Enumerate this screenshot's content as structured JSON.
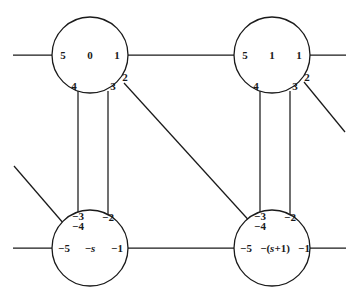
{
  "figure": {
    "type": "graph-diagram",
    "background_color": "#ffffff",
    "line_color": "#1a1a1a"
  },
  "nodes": [
    {
      "id": "node-top-left",
      "center_label": "0",
      "ports": {
        "left": "5",
        "right": "1",
        "outer_right": "2",
        "bottom_right": "3",
        "bottom_left": "4"
      }
    },
    {
      "id": "node-top-right",
      "center_label": "1",
      "ports": {
        "left": "5",
        "right": "1",
        "outer_right": "2",
        "bottom_right": "3",
        "bottom_left": "4"
      }
    },
    {
      "id": "node-bottom-left",
      "center_label": "−s",
      "ports": {
        "left": "−5",
        "right": "−1",
        "top_right": "−2",
        "top_left_upper": "−3",
        "top_left_lower": "−4"
      }
    },
    {
      "id": "node-bottom-right",
      "center_label": "−(s+1)",
      "ports": {
        "left": "−5",
        "right": "−1",
        "top_right": "−2",
        "top_left_upper": "−3",
        "top_left_lower": "−4"
      }
    }
  ],
  "edges": [
    {
      "name": "edge-top-left-to-top-right",
      "from": "node-top-left.right(1)",
      "to": "node-top-right.left(5)"
    },
    {
      "name": "edge-topleft-4-to-bottomleft-3",
      "from": "node-top-left.bottom_left(4)",
      "to": "node-bottom-left.top_left_upper(−3)"
    },
    {
      "name": "edge-topleft-3-to-bottomleft-2",
      "from": "node-top-left.bottom_right(3)",
      "to": "node-bottom-left.top_right(−2)"
    },
    {
      "name": "edge-topleft-2-to-bottomright-34",
      "from": "node-top-left.outer_right(2)",
      "to": "node-bottom-right.top_left(−3/−4)"
    },
    {
      "name": "edge-topright-4-to-bottomright-3",
      "from": "node-top-right.bottom_left(4)",
      "to": "node-bottom-right.top_left_upper(−3)"
    },
    {
      "name": "edge-topright-3-to-bottomright-2",
      "from": "node-top-right.bottom_right(3)",
      "to": "node-bottom-right.top_right(−2)"
    },
    {
      "name": "edge-bottom-left-to-bottom-right",
      "from": "node-bottom-left.right(−1)",
      "to": "node-bottom-right.left(−5)"
    }
  ],
  "stubs": [
    {
      "name": "stub-top-left-west",
      "attached_to": "node-top-left.left(5)",
      "direction": "west"
    },
    {
      "name": "stub-top-right-east",
      "attached_to": "node-top-right.right(1)",
      "direction": "east"
    },
    {
      "name": "stub-top-right-southeast",
      "attached_to": "node-top-right.outer_right(2)",
      "direction": "southeast"
    },
    {
      "name": "stub-bottom-left-northwest",
      "attached_to": "node-bottom-left.top_left(−3/−4)",
      "direction": "northwest"
    },
    {
      "name": "stub-bottom-left-west",
      "attached_to": "node-bottom-left.left(−5)",
      "direction": "west"
    },
    {
      "name": "stub-bottom-right-east",
      "attached_to": "node-bottom-right.right(−1)",
      "direction": "east"
    }
  ]
}
